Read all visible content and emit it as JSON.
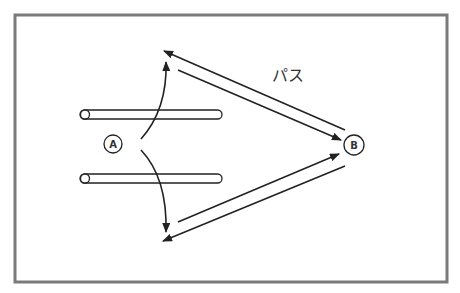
{
  "diagram": {
    "type": "pass-diagram",
    "label": "パス",
    "colors": {
      "frame": "#7a7a7a",
      "stroke": "#222222",
      "background": "#ffffff"
    },
    "nodes": [
      {
        "id": "A",
        "label": "A",
        "cx": 113,
        "cy": 144,
        "r": 9
      },
      {
        "id": "B",
        "label": "B",
        "cx": 354,
        "cy": 145,
        "r": 10
      }
    ],
    "bars": [
      {
        "id": "upper-bar",
        "x": 80,
        "y": 110,
        "width": 142,
        "height": 9
      },
      {
        "id": "lower-bar",
        "x": 80,
        "y": 174,
        "width": 142,
        "height": 9
      }
    ],
    "edges": [
      {
        "id": "curve-up",
        "from": "A",
        "to": "top-point",
        "kind": "curved-arrow"
      },
      {
        "id": "curve-down",
        "from": "A",
        "to": "bottom-point",
        "kind": "curved-arrow"
      },
      {
        "id": "pass-top-to-B",
        "from": "top-point",
        "to": "B",
        "kind": "arrow"
      },
      {
        "id": "pass-B-to-top",
        "from": "B",
        "to": "top-point",
        "kind": "arrow"
      },
      {
        "id": "pass-bottom-to-B",
        "from": "bottom-point",
        "to": "B",
        "kind": "arrow"
      },
      {
        "id": "pass-B-to-bottom",
        "from": "B",
        "to": "bottom-point",
        "kind": "arrow"
      }
    ]
  }
}
